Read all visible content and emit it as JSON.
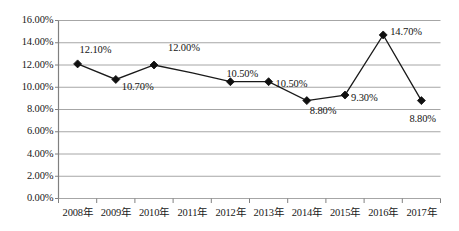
{
  "chart_data": {
    "type": "line",
    "title": "",
    "subtitle": "",
    "xlabel": "",
    "ylabel": "",
    "ylim": [
      0,
      16
    ],
    "ytick_labels": [
      "0.00%",
      "2.00%",
      "4.00%",
      "6.00%",
      "8.00%",
      "10.00%",
      "12.00%",
      "14.00%",
      "16.00%"
    ],
    "ytick_values": [
      0,
      2,
      4,
      6,
      8,
      10,
      12,
      14,
      16
    ],
    "grid": "horizontal",
    "legend": "none",
    "marker": "diamond",
    "categories": [
      "2008年",
      "2009年",
      "2010年",
      "2011年",
      "2012年",
      "2013年",
      "2014年",
      "2015年",
      "2016年",
      "2017年"
    ],
    "values": [
      12.1,
      10.7,
      12.0,
      11.3,
      10.5,
      10.5,
      8.8,
      9.3,
      14.7,
      8.8
    ],
    "point_labels": [
      {
        "category": "2008年",
        "text": "12.10%",
        "value": 12.1
      },
      {
        "category": "2009年",
        "text": "10.70%",
        "value": 10.7
      },
      {
        "category": "2010年",
        "text": "12.00%",
        "value": 12.0
      },
      {
        "category": "2012年",
        "text": "10.50%",
        "value": 10.5
      },
      {
        "category": "2013年",
        "text": "10.50%",
        "value": 10.5
      },
      {
        "category": "2014年",
        "text": "8.80%",
        "value": 8.8
      },
      {
        "category": "2015年",
        "text": "9.30%",
        "value": 9.3
      },
      {
        "category": "2016年",
        "text": "14.70%",
        "value": 14.7
      },
      {
        "category": "2017年",
        "text": "8.80%",
        "value": 8.8
      }
    ],
    "colors": {
      "line": "#1a1a1a",
      "marker": "#101010",
      "grid": "#a6a6a6",
      "axis": "#808080",
      "background": "#ffffff",
      "text": "#202020"
    }
  }
}
